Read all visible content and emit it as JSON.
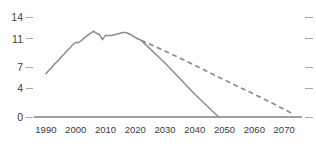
{
  "chart_data": {
    "type": "line",
    "title": "",
    "subtitle": "",
    "xlabel": "",
    "ylabel": "",
    "xlim": [
      1986,
      2076
    ],
    "ylim": [
      0,
      14.8
    ],
    "grid": false,
    "legend_position": "none",
    "x_ticks": [
      1990,
      2000,
      2010,
      2020,
      2030,
      2040,
      2050,
      2060,
      2070
    ],
    "x_tick_labels": [
      "1990",
      "2000",
      "2010",
      "2020",
      "2030",
      "2040",
      "2050",
      "2060",
      "2070"
    ],
    "y_ticks": [
      0,
      4,
      7,
      11,
      14
    ],
    "y_tick_labels": [
      "0",
      "4",
      "7",
      "11",
      "14"
    ],
    "right_axis_ticks": [
      0,
      4,
      7,
      11,
      14
    ],
    "series": [
      {
        "name": "historical-and-solid-decline",
        "style": "solid",
        "color": "#8c8c8c",
        "x": [
          1990,
          1991,
          1992,
          1993,
          1994,
          1995,
          1996,
          1997,
          1998,
          1999,
          2000,
          2001,
          2002,
          2003,
          2004,
          2005,
          2006,
          2007,
          2008,
          2009,
          2010,
          2011,
          2012,
          2013,
          2014,
          2015,
          2016,
          2017,
          2018,
          2019,
          2020,
          2021,
          2022,
          2030,
          2040,
          2048
        ],
        "y": [
          6.1,
          6.6,
          7.0,
          7.5,
          7.9,
          8.4,
          8.8,
          9.3,
          9.7,
          10.2,
          10.5,
          10.5,
          10.8,
          11.2,
          11.5,
          11.8,
          12.1,
          11.8,
          11.6,
          10.9,
          11.5,
          11.5,
          11.5,
          11.6,
          11.7,
          11.8,
          11.9,
          11.9,
          11.7,
          11.5,
          11.2,
          11.0,
          10.8,
          7.6,
          3.2,
          0.0
        ]
      },
      {
        "name": "dashed-decline-scenario",
        "style": "dashed",
        "color": "#8c8c8c",
        "x": [
          2022,
          2030,
          2040,
          2050,
          2060,
          2070,
          2073
        ],
        "y": [
          10.8,
          9.3,
          7.3,
          5.2,
          3.2,
          1.1,
          0.4
        ]
      }
    ],
    "annotations": []
  }
}
